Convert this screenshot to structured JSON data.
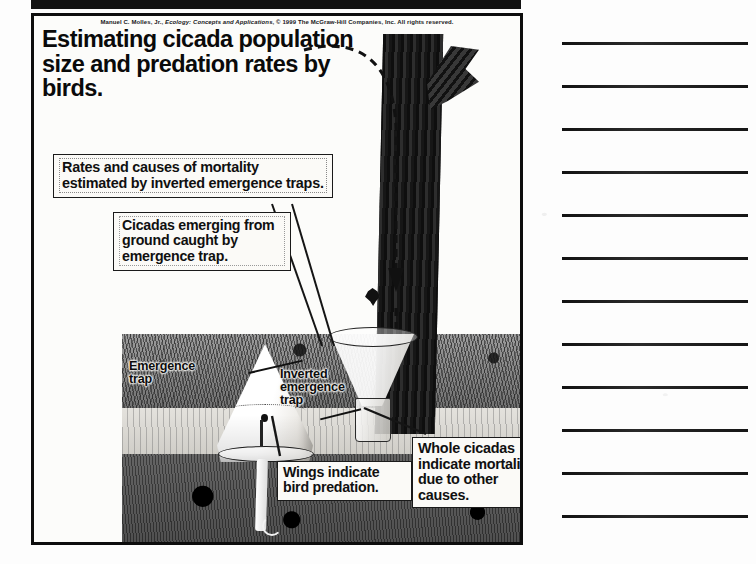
{
  "page": {
    "kind": "lecture-handout-scan",
    "width": 756,
    "height": 564
  },
  "figure": {
    "credit_author": "Manuel C. Molles, Jr., ",
    "credit_title": "Ecology: Concepts and Applications",
    "credit_rest": ", © 1999 The McGraw-Hill Companies, Inc. All rights reserved.",
    "credit_full": "Manuel C. Molles, Jr., Ecology: Concepts and Applications, © 1999 The McGraw-Hill Companies, Inc. All rights reserved.",
    "title": "Estimating cicada population size and predation rates by birds.",
    "callouts": [
      {
        "id": "mortality",
        "text": "Rates and causes of mortality estimated by inverted emergence traps."
      },
      {
        "id": "emerging",
        "text": "Cicadas emerging from ground caught by emergence trap."
      },
      {
        "id": "wings",
        "text": "Wings indicate bird predation."
      },
      {
        "id": "whole",
        "text": "Whole cicadas indicate mortality due to other causes."
      }
    ],
    "labels": [
      {
        "id": "emergence-trap",
        "text": "Emergence trap"
      },
      {
        "id": "inverted-emergence-trap",
        "text": "Inverted emergence trap"
      }
    ],
    "scene_elements": [
      "tree-trunk",
      "tree-branch",
      "grass-ground",
      "soil-cross-section",
      "emergence-trap-cone",
      "inverted-emergence-trap-funnel",
      "collection-jar",
      "underground-emergence-tube",
      "cicada",
      "dashed-bird-flight-path"
    ],
    "colors": {
      "border": "#0d0d0d",
      "paper": "#fcfcfa",
      "text": "#0a0a0a",
      "trunk": "#1a1a1a"
    }
  },
  "notes": {
    "line_count": 12,
    "lines": [
      "",
      "",
      "",
      "",
      "",
      "",
      "",
      "",
      "",
      "",
      "",
      ""
    ]
  }
}
